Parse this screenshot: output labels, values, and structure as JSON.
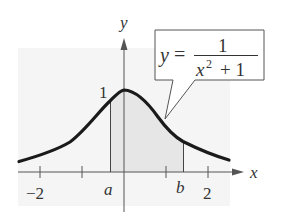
{
  "figure": {
    "type": "function-graph",
    "function_label": {
      "lhs": "y",
      "equals": "=",
      "numerator": "1",
      "denominator_base": "x",
      "denominator_exponent": "2",
      "denominator_rest": "+ 1"
    },
    "axes": {
      "x_label": "x",
      "y_label": "y",
      "x_tick_labels": [
        "−2",
        "2"
      ],
      "y_tick_labels": [
        "1"
      ]
    },
    "markers": {
      "a_label": "a",
      "b_label": "b"
    },
    "colors": {
      "curve": "#1a1a1a",
      "axis": "#555555",
      "shaded_region": "#ededed",
      "background_panel": "#f4f4f4",
      "text": "#333333"
    }
  }
}
